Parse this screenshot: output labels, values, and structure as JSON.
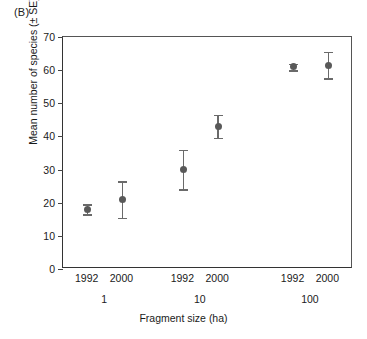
{
  "panel": {
    "label": "(B)"
  },
  "chart_data": {
    "type": "scatter",
    "title": "(B)",
    "xlabel": "Fragment size (ha)",
    "ylabel": "Mean number of species (± SE)",
    "ylim": [
      0,
      70
    ],
    "yticks": [
      0,
      10,
      20,
      30,
      40,
      50,
      60,
      70
    ],
    "ytick_labels": [
      "0",
      "10",
      "20",
      "30",
      "40",
      "50",
      "60",
      "70"
    ],
    "grid": false,
    "legend": null,
    "error_bars": "SE",
    "marker_color": "#595959",
    "errorbar_color": "#6a6a6a",
    "axis_color": "#333333",
    "group_labels": [
      "1",
      "10",
      "100"
    ],
    "year_labels": [
      "1992",
      "2000",
      "1992",
      "2000",
      "1992",
      "2000"
    ],
    "categories": [
      "1 ha 1992",
      "1 ha 2000",
      "10 ha 1992",
      "10 ha 2000",
      "100 ha 1992",
      "100 ha 2000"
    ],
    "values": [
      18,
      21,
      30,
      43,
      61,
      61.5
    ],
    "errors": [
      1.5,
      5.5,
      6,
      3.5,
      1,
      4
    ],
    "points": [
      {
        "group": "1",
        "year": "1992",
        "mean": 18,
        "se": 1.5,
        "x_frac": 0.085
      },
      {
        "group": "1",
        "year": "2000",
        "mean": 21,
        "se": 5.5,
        "x_frac": 0.205
      },
      {
        "group": "10",
        "year": "1992",
        "mean": 30,
        "se": 6,
        "x_frac": 0.415
      },
      {
        "group": "10",
        "year": "2000",
        "mean": 43,
        "se": 3.5,
        "x_frac": 0.535
      },
      {
        "group": "100",
        "year": "1992",
        "mean": 61,
        "se": 1,
        "x_frac": 0.795
      },
      {
        "group": "100",
        "year": "2000",
        "mean": 61.5,
        "se": 4,
        "x_frac": 0.915
      }
    ],
    "group_positions": [
      0.145,
      0.475,
      0.855
    ]
  }
}
